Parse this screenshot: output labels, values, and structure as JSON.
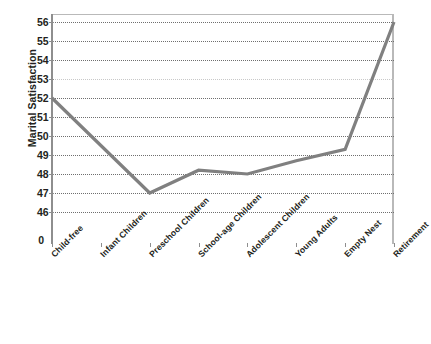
{
  "chart_data": {
    "type": "line",
    "title": "",
    "xlabel": "",
    "ylabel": "Marital Satisfaction",
    "categories": [
      "Child-free",
      "Infant Children",
      "Preschool Children",
      "School-age Children",
      "Adolescent Children",
      "Young Adults",
      "Empty Nest",
      "Retirement"
    ],
    "values": [
      52,
      49.5,
      47,
      48.2,
      48,
      48.7,
      49.3,
      56
    ],
    "series": [
      {
        "name": "Marital Satisfaction",
        "values": [
          52,
          49.5,
          47,
          48.2,
          48,
          48.7,
          49.3,
          56
        ]
      }
    ],
    "ylim": [
      46,
      56
    ],
    "y_tick_labels": [
      "56",
      "55",
      "54",
      "53",
      "52",
      "51",
      "50",
      "49",
      "48",
      "47",
      "46",
      "0"
    ],
    "y_ticks": [
      56,
      55,
      54,
      53,
      52,
      51,
      50,
      49,
      48,
      47,
      46,
      0
    ],
    "axis_break": true,
    "grid": "horizontal-dotted",
    "legend": "none",
    "line_color": "#808080",
    "grid_color": "#6f6f6f",
    "frame_color": "#b9b9b9",
    "text_color": "#231f20"
  },
  "axis": {
    "y_title": "Marital Satisfaction",
    "zero_label": "0"
  }
}
